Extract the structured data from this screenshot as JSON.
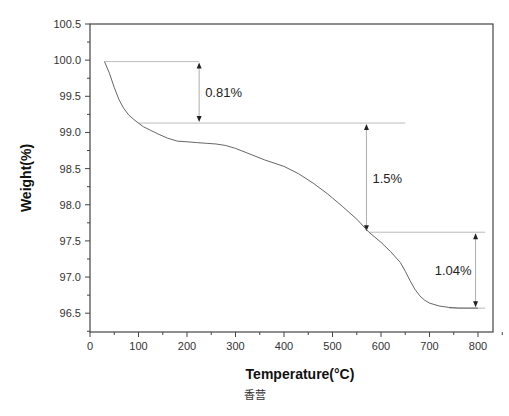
{
  "chart_data": {
    "type": "line",
    "title": "",
    "xlabel": "Temperature(°C)",
    "ylabel": "Weight(%)",
    "xlim": [
      0,
      850
    ],
    "ylim": [
      96.25,
      100.5
    ],
    "xticks": [
      0,
      100,
      200,
      300,
      400,
      500,
      600,
      700,
      800
    ],
    "yticks": [
      96.5,
      97.0,
      97.5,
      98.0,
      98.5,
      99.0,
      99.5,
      100.0,
      100.5
    ],
    "ytick_labels": [
      "96.5",
      "97.0",
      "97.5",
      "98.0",
      "98.5",
      "99.0",
      "99.5",
      "100.0",
      "100.5"
    ],
    "grid": false,
    "legend": null,
    "series": [
      {
        "name": "TGA",
        "x": [
          30,
          40,
          50,
          60,
          70,
          80,
          90,
          100,
          110,
          125,
          140,
          160,
          180,
          200,
          220,
          240,
          260,
          280,
          300,
          330,
          360,
          400,
          430,
          460,
          490,
          520,
          550,
          575,
          600,
          620,
          640,
          650,
          660,
          670,
          680,
          690,
          700,
          720,
          740,
          760,
          780,
          800
        ],
        "y": [
          99.98,
          99.82,
          99.62,
          99.45,
          99.33,
          99.24,
          99.18,
          99.13,
          99.08,
          99.03,
          98.98,
          98.92,
          98.88,
          98.87,
          98.86,
          98.85,
          98.84,
          98.82,
          98.78,
          98.7,
          98.62,
          98.53,
          98.43,
          98.3,
          98.15,
          97.98,
          97.8,
          97.62,
          97.48,
          97.35,
          97.2,
          97.08,
          96.95,
          96.83,
          96.74,
          96.68,
          96.64,
          96.6,
          96.58,
          96.57,
          96.57,
          96.57
        ]
      }
    ],
    "annotations": [
      {
        "label": "0.81%",
        "x": 225,
        "y_top": 99.98,
        "y_bottom": 99.13,
        "line_from_x": 30,
        "line_to_x": 225
      },
      {
        "label": "1.5%",
        "x": 570,
        "y_top": 99.13,
        "y_bottom": 97.62,
        "line_from_x": 100,
        "line_to_x": 650
      },
      {
        "label": "1.04%",
        "x": 795,
        "y_top": 97.62,
        "y_bottom": 96.57,
        "line_from_x": 575,
        "line_to_x": 815
      }
    ]
  },
  "caption": "香营"
}
